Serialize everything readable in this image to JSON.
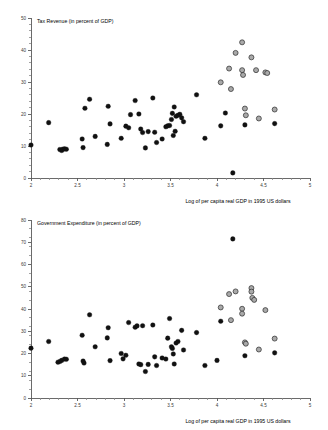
{
  "figure": {
    "background": "#ffffff",
    "dark_marker_color": "#111111",
    "grey_marker_color": "#a9a9a9",
    "grey_marker_edge_color": "#2b2b2b",
    "axis_color": "#5a5a5a"
  },
  "panels": {
    "top": {
      "title": "Tax Revenue (in percent of GDP)",
      "xlabel": "Log of per capita real GDP in 1995 US dollars",
      "ylabel": "",
      "xticks": [
        "2",
        "2.5",
        "3",
        "3.5",
        "4",
        "4.5",
        "5"
      ],
      "yticks": [
        "0",
        "10",
        "20",
        "30",
        "40",
        "50"
      ]
    },
    "bottom": {
      "title": "Government Expenditure (in percent of GDP)",
      "xlabel": "Log of per capita real GDP in 1995 US dollars",
      "ylabel": "",
      "xticks": [
        "2",
        "2.5",
        "3",
        "3.5",
        "4",
        "4.5",
        "5"
      ],
      "yticks": [
        "0",
        "10",
        "20",
        "30",
        "40",
        "50",
        "60",
        "70",
        "80"
      ]
    }
  },
  "chart_data": [
    {
      "type": "scatter",
      "id": "tax-revenue",
      "title": "Tax Revenue (in percent of GDP)",
      "xlabel": "Log of per capita real GDP in 1995 US dollars",
      "ylabel": "Tax Revenue (in percent of GDP)",
      "xlim": [
        2,
        5
      ],
      "ylim": [
        0,
        50
      ],
      "xtick_values": [
        2,
        2.5,
        3,
        3.5,
        4,
        4.5,
        5
      ],
      "ytick_values": [
        0,
        10,
        20,
        30,
        40,
        50
      ],
      "xtick_minor_step": 0.1,
      "ytick_minor_step": 2,
      "grid": false,
      "legend": null,
      "series": [
        {
          "name": "developing-economies",
          "marker": "filled-circle",
          "color": "#111111",
          "points": [
            [
              2.0,
              10.3
            ],
            [
              2.19,
              17.3
            ],
            [
              2.31,
              8.9
            ],
            [
              2.33,
              8.6
            ],
            [
              2.34,
              9.0
            ],
            [
              2.36,
              9.1
            ],
            [
              2.38,
              9.0
            ],
            [
              2.55,
              12.2
            ],
            [
              2.56,
              9.5
            ],
            [
              2.58,
              21.8
            ],
            [
              2.63,
              24.6
            ],
            [
              2.69,
              13.0
            ],
            [
              2.82,
              10.5
            ],
            [
              2.83,
              22.4
            ],
            [
              2.85,
              16.9
            ],
            [
              2.97,
              12.4
            ],
            [
              3.02,
              16.2
            ],
            [
              3.05,
              15.7
            ],
            [
              3.07,
              19.8
            ],
            [
              3.12,
              24.2
            ],
            [
              3.16,
              20.0
            ],
            [
              3.18,
              15.3
            ],
            [
              3.2,
              14.2
            ],
            [
              3.23,
              9.4
            ],
            [
              3.26,
              14.5
            ],
            [
              3.31,
              25.0
            ],
            [
              3.33,
              14.3
            ],
            [
              3.35,
              11.1
            ],
            [
              3.41,
              12.2
            ],
            [
              3.45,
              16.0
            ],
            [
              3.47,
              16.3
            ],
            [
              3.49,
              16.4
            ],
            [
              3.51,
              18.3
            ],
            [
              3.52,
              20.2
            ],
            [
              3.53,
              13.3
            ],
            [
              3.54,
              22.2
            ],
            [
              3.55,
              14.6
            ],
            [
              3.56,
              19.3
            ],
            [
              3.58,
              19.6
            ],
            [
              3.6,
              19.9
            ],
            [
              3.62,
              18.8
            ],
            [
              3.64,
              17.6
            ],
            [
              3.78,
              26.0
            ],
            [
              3.87,
              12.4
            ],
            [
              4.04,
              16.3
            ],
            [
              4.09,
              20.3
            ],
            [
              4.17,
              1.6
            ],
            [
              4.3,
              16.6
            ],
            [
              4.62,
              17.0
            ]
          ]
        },
        {
          "name": "advanced-economies",
          "marker": "filled-circle-outlined",
          "color": "#a9a9a9",
          "edge_color": "#2b2b2b",
          "points": [
            [
              4.04,
              29.9
            ],
            [
              4.13,
              34.2
            ],
            [
              4.15,
              27.8
            ],
            [
              4.2,
              39.1
            ],
            [
              4.27,
              42.4
            ],
            [
              4.27,
              33.7
            ],
            [
              4.28,
              32.2
            ],
            [
              4.3,
              21.7
            ],
            [
              4.31,
              19.6
            ],
            [
              4.37,
              37.7
            ],
            [
              4.42,
              33.7
            ],
            [
              4.45,
              18.6
            ],
            [
              4.52,
              33.0
            ],
            [
              4.54,
              32.8
            ],
            [
              4.62,
              21.4
            ]
          ]
        }
      ]
    },
    {
      "type": "scatter",
      "id": "government-expenditure",
      "title": "Government Expenditure (in percent of GDP)",
      "xlabel": "Log of per capita real GDP in 1995 US dollars",
      "ylabel": "Government Expenditure (in percent of GDP)",
      "xlim": [
        2,
        5
      ],
      "ylim": [
        0,
        80
      ],
      "xtick_values": [
        2,
        2.5,
        3,
        3.5,
        4,
        4.5,
        5
      ],
      "ytick_values": [
        0,
        10,
        20,
        30,
        40,
        50,
        60,
        70,
        80
      ],
      "xtick_minor_step": 0.1,
      "ytick_minor_step": 4,
      "grid": false,
      "legend": null,
      "series": [
        {
          "name": "developing-economies",
          "marker": "filled-circle",
          "color": "#111111",
          "points": [
            [
              2.0,
              22.4
            ],
            [
              2.19,
              25.4
            ],
            [
              2.29,
              16.1
            ],
            [
              2.31,
              16.4
            ],
            [
              2.33,
              16.9
            ],
            [
              2.36,
              17.5
            ],
            [
              2.38,
              17.4
            ],
            [
              2.55,
              28.2
            ],
            [
              2.56,
              16.6
            ],
            [
              2.57,
              15.7
            ],
            [
              2.63,
              37.4
            ],
            [
              2.69,
              23.0
            ],
            [
              2.82,
              27.0
            ],
            [
              2.83,
              31.6
            ],
            [
              2.85,
              16.8
            ],
            [
              2.97,
              20.0
            ],
            [
              2.99,
              17.6
            ],
            [
              3.02,
              19.2
            ],
            [
              3.05,
              33.9
            ],
            [
              3.12,
              31.8
            ],
            [
              3.14,
              32.4
            ],
            [
              3.16,
              15.3
            ],
            [
              3.18,
              15.0
            ],
            [
              3.2,
              32.5
            ],
            [
              3.23,
              11.9
            ],
            [
              3.26,
              15.1
            ],
            [
              3.31,
              32.8
            ],
            [
              3.33,
              18.5
            ],
            [
              3.35,
              14.6
            ],
            [
              3.41,
              18.0
            ],
            [
              3.45,
              17.5
            ],
            [
              3.47,
              26.9
            ],
            [
              3.49,
              35.7
            ],
            [
              3.51,
              23.0
            ],
            [
              3.52,
              22.3
            ],
            [
              3.53,
              19.8
            ],
            [
              3.54,
              15.3
            ],
            [
              3.56,
              24.7
            ],
            [
              3.58,
              25.4
            ],
            [
              3.62,
              30.4
            ],
            [
              3.64,
              21.6
            ],
            [
              3.78,
              29.4
            ],
            [
              3.87,
              14.6
            ],
            [
              4.0,
              16.9
            ],
            [
              4.04,
              34.5
            ],
            [
              4.17,
              71.5
            ],
            [
              4.3,
              19.0
            ],
            [
              4.62,
              20.3
            ]
          ]
        },
        {
          "name": "advanced-economies",
          "marker": "filled-circle-outlined",
          "color": "#a9a9a9",
          "edge_color": "#2b2b2b",
          "points": [
            [
              4.04,
              40.7
            ],
            [
              4.13,
              46.7
            ],
            [
              4.15,
              35.0
            ],
            [
              4.2,
              47.9
            ],
            [
              4.27,
              40.1
            ],
            [
              4.27,
              37.9
            ],
            [
              4.3,
              25.0
            ],
            [
              4.31,
              24.4
            ],
            [
              4.37,
              49.4
            ],
            [
              4.37,
              47.8
            ],
            [
              4.38,
              45.0
            ],
            [
              4.4,
              44.1
            ],
            [
              4.45,
              21.8
            ],
            [
              4.52,
              39.5
            ],
            [
              4.62,
              26.7
            ]
          ]
        }
      ]
    }
  ]
}
